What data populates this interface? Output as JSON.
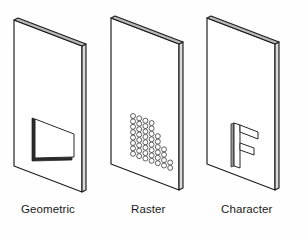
{
  "figure": {
    "background_color": "#fefefe",
    "line_color": "#1b1b1b",
    "edge_shade_color": "#d9d9d9",
    "panel_count": 3
  },
  "panels": [
    {
      "id": "geometric",
      "label": "Geometric",
      "content_kind": "rectangle-outline",
      "description": "A single hollow rectangle (vector/geometric primitive) drawn on the sheet",
      "content_color": "#ffffff",
      "content_stroke": "#2b2b2b"
    },
    {
      "id": "raster",
      "label": "Raster",
      "content_kind": "dot-matrix",
      "description": "A grid of small circular dots forming a filled pixel block",
      "dot_columns": 7,
      "dot_rows": 8,
      "dot_color": "#ffffff",
      "dot_stroke": "#2d2d2d"
    },
    {
      "id": "character",
      "label": "Character",
      "content_kind": "letter-outline",
      "letter": "F",
      "description": "An outlined capital letter F glyph rendered on the sheet",
      "content_color": "#ffffff",
      "content_stroke": "#262626"
    }
  ],
  "captions": {
    "geometric": "Geometric",
    "raster": "Raster",
    "character": "Character"
  }
}
